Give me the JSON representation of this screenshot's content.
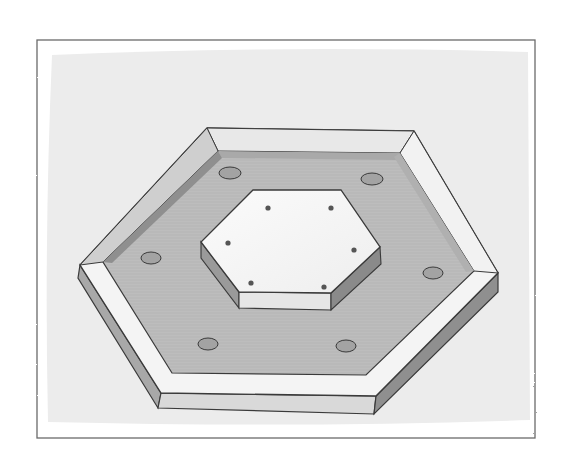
{
  "illustration": {
    "subject": "hexagonal tray with raised rim and raised hexagonal center plate",
    "colors": {
      "background": "#ffffff",
      "wash": "#ececec",
      "frame_line": "#6a6a6a",
      "rim_top": "#f4f4f4",
      "rim_side": "#a8a8a8",
      "rim_inner": "#c4c4c4",
      "tray_floor": "#b9b9b9",
      "plate_top": "#f7f7f7",
      "plate_side": "#9a9a9a",
      "plate_front": "#e6e6e6",
      "hole": "#a3a3a3",
      "outline": "#3a3a3a"
    },
    "tray_holes": 6,
    "plate_holes": 6
  }
}
